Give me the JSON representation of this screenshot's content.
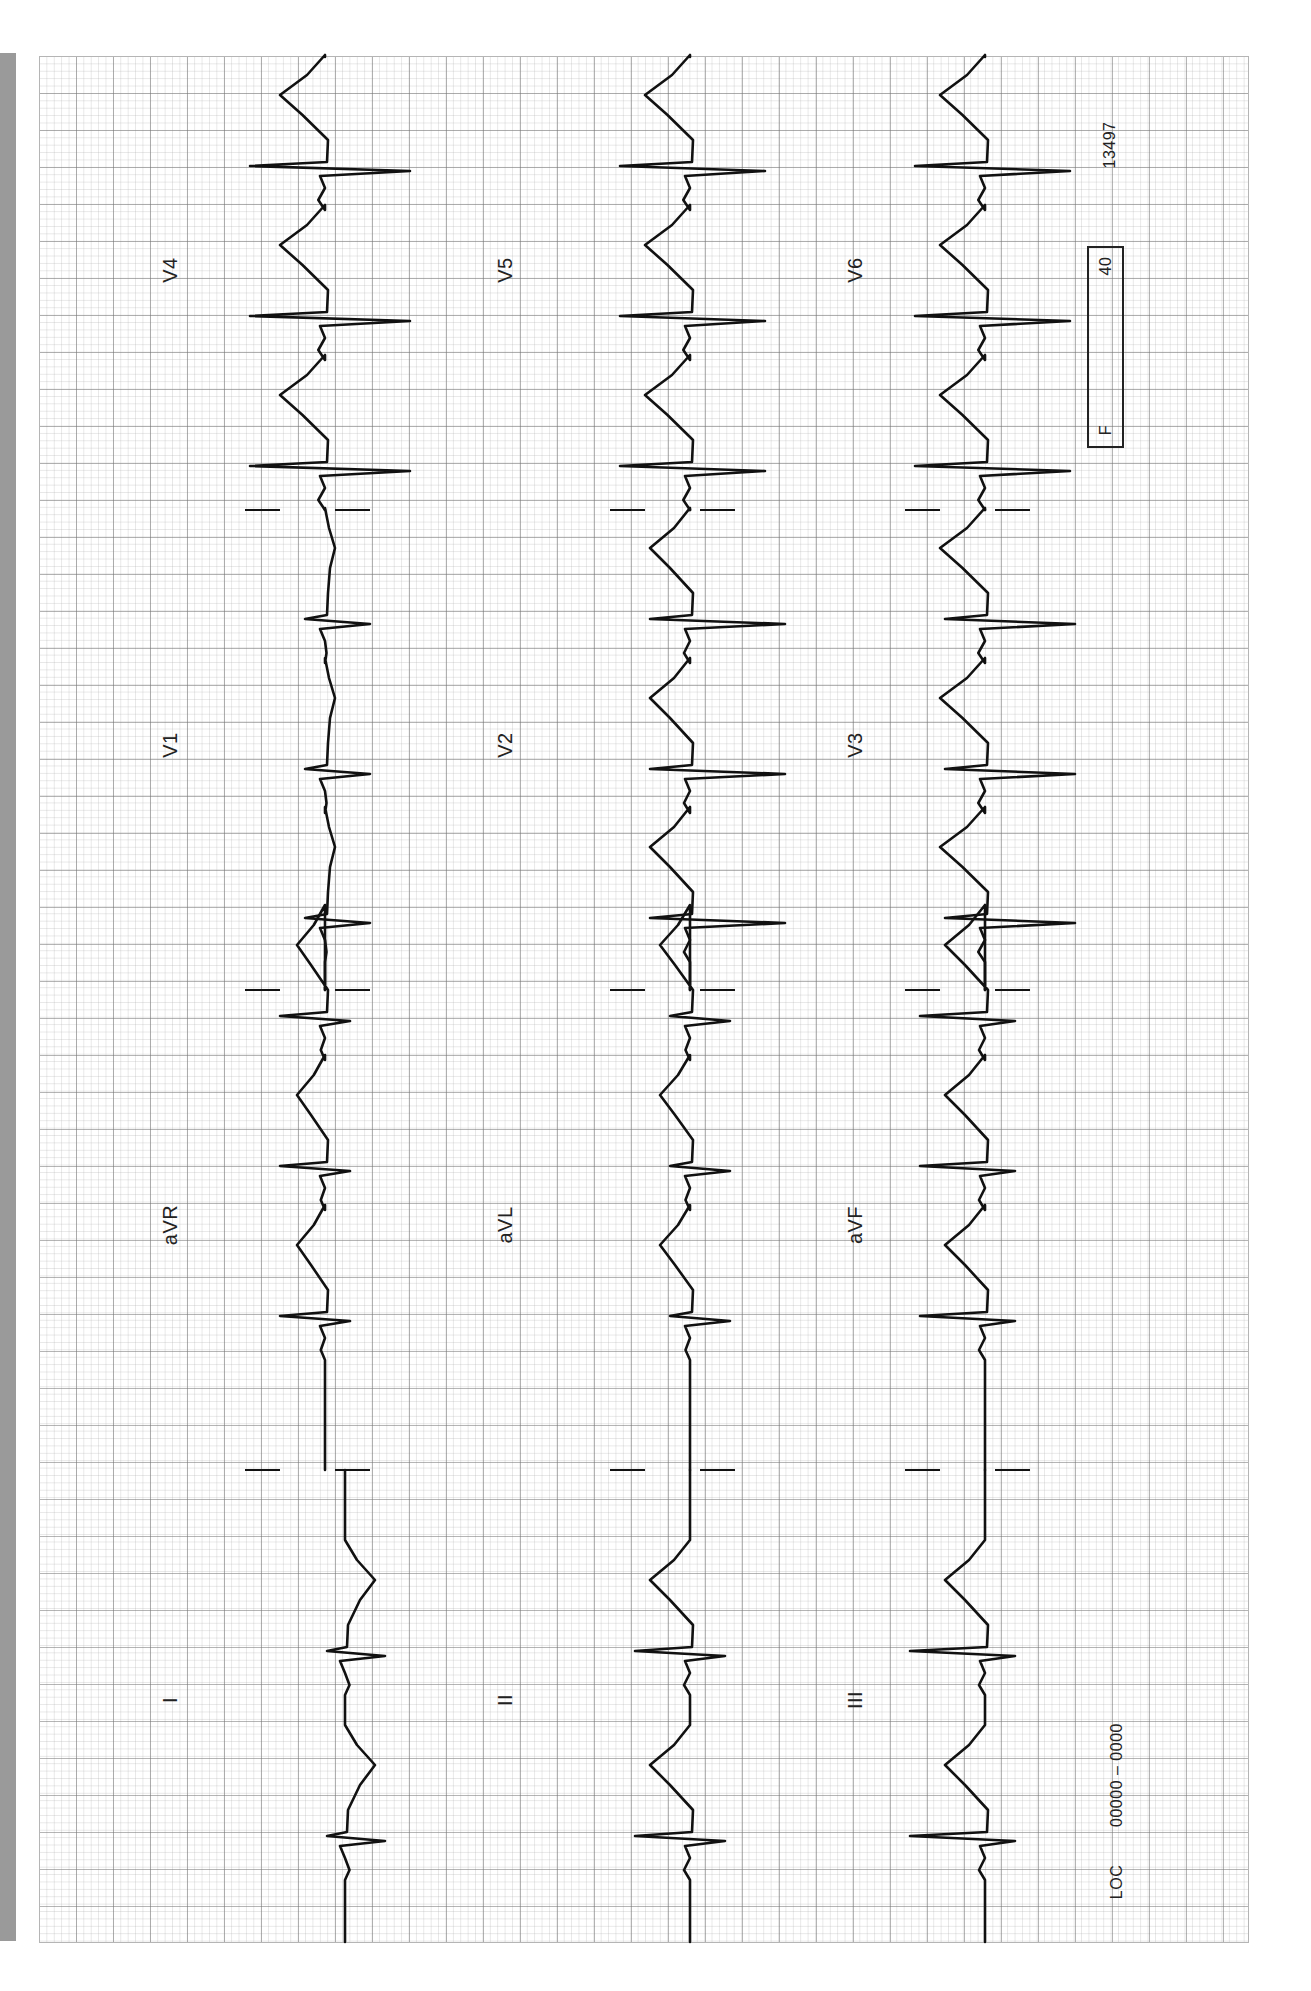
{
  "ecg": {
    "lead_labels": {
      "I": "I",
      "aVR": "aVR",
      "V1": "V1",
      "V4": "V4",
      "II": "II",
      "aVL": "aVL",
      "V2": "V2",
      "V5": "V5",
      "III": "III",
      "aVF": "aVF",
      "V3": "V3",
      "V6": "V6"
    },
    "footer": {
      "location": "LOC",
      "location_code": "00000 – 0000",
      "filter_label": "F",
      "filter_value": "40",
      "record_number": "13497"
    },
    "layout": {
      "rows": [
        {
          "baseline_x": 345,
          "leads": [
            "I",
            "aVR",
            "V1",
            "V4"
          ],
          "label_x": 170
        },
        {
          "baseline_x": 690,
          "leads": [
            "II",
            "aVL",
            "V2",
            "V5"
          ],
          "label_x": 505
        },
        {
          "baseline_x": 985,
          "leads": [
            "III",
            "aVF",
            "V3",
            "V6"
          ],
          "label_x": 855
        }
      ],
      "segment_bounds_y": [
        1942,
        1470,
        990,
        510,
        57
      ],
      "label_y": [
        1700,
        1225,
        745,
        270
      ]
    },
    "beats_y": [
      1840,
      1655,
      1320,
      1170,
      1020,
      922,
      773,
      623,
      470,
      320,
      170
    ],
    "amplitudes": {
      "I": {
        "r": 40,
        "s": -18,
        "t": 30
      },
      "aVR": {
        "r": 25,
        "s": -45,
        "t": -28
      },
      "V1": {
        "r": 45,
        "s": -20,
        "t": 10
      },
      "V4": {
        "r": 85,
        "s": -75,
        "t": -45
      },
      "II": {
        "r": 35,
        "s": -55,
        "t": -40
      },
      "aVL": {
        "r": 40,
        "s": -20,
        "t": -30
      },
      "V2": {
        "r": 95,
        "s": -40,
        "t": -40
      },
      "V5": {
        "r": 75,
        "s": -70,
        "t": -45
      },
      "III": {
        "r": 30,
        "s": -75,
        "t": -40
      },
      "aVF": {
        "r": 30,
        "s": -65,
        "t": -40
      },
      "V3": {
        "r": 90,
        "s": -40,
        "t": -45
      },
      "V6": {
        "r": 85,
        "s": -70,
        "t": -45
      }
    },
    "trace_color": "#111111"
  }
}
